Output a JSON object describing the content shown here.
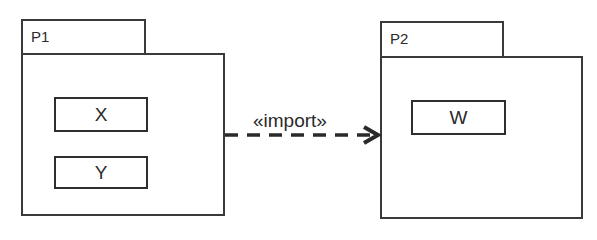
{
  "diagram": {
    "type": "UML package diagram",
    "packages": [
      {
        "name": "P1",
        "classes": [
          "X",
          "Y"
        ]
      },
      {
        "name": "P2",
        "classes": [
          "W"
        ]
      }
    ],
    "dependency": {
      "from": "P1",
      "to": "P2",
      "stereotype": "«import»",
      "style": "dashed",
      "arrowhead": "open"
    }
  },
  "colors": {
    "stroke": "#3a3a3a",
    "background": "#ffffff",
    "text": "#2a2a2a"
  }
}
